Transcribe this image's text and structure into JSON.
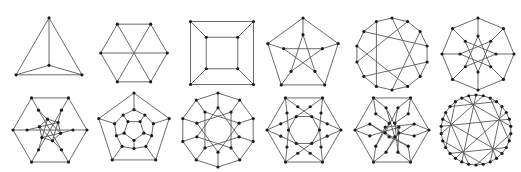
{
  "figure": {
    "edge_color": "#5a5a5a",
    "vertex_color": "#1c1c1c",
    "vertex_radius": 1.6
  },
  "graphs": [
    {
      "name": "K4",
      "row": 0,
      "cx": 49,
      "cy": 52,
      "r": 38,
      "kind": "k4"
    },
    {
      "name": "K3,3",
      "row": 0,
      "cx": 134,
      "cy": 53,
      "r": 37,
      "kind": "k33"
    },
    {
      "name": "Cube",
      "row": 0,
      "cx": 222,
      "cy": 53,
      "r": 45,
      "kind": "cube"
    },
    {
      "name": "Petersen",
      "row": 0,
      "cx": 303,
      "cy": 55,
      "r": 37,
      "kind": "gp",
      "n": 5,
      "k": 2,
      "inner": 0.55
    },
    {
      "name": "Heawood",
      "row": 0,
      "cx": 392,
      "cy": 54,
      "r": 36,
      "kind": "lcf",
      "n": 14,
      "lcf": [
        5,
        -5
      ]
    },
    {
      "name": "Mobius-Kantor",
      "row": 0,
      "cx": 478,
      "cy": 54,
      "r": 36,
      "kind": "gp",
      "n": 8,
      "k": 3,
      "inner": 0.5
    },
    {
      "name": "Pappus",
      "row": 1,
      "cx": 50,
      "cy": 130,
      "r": 37,
      "kind": "pappus"
    },
    {
      "name": "Dodecahedron",
      "row": 1,
      "cx": 134,
      "cy": 130,
      "r": 37,
      "kind": "dodeca"
    },
    {
      "name": "Desargues",
      "row": 1,
      "cx": 218,
      "cy": 130,
      "r": 37,
      "kind": "gp",
      "n": 10,
      "k": 3,
      "inner": 0.6
    },
    {
      "name": "Nauru",
      "row": 1,
      "cx": 304,
      "cy": 130,
      "r": 37,
      "kind": "nauru"
    },
    {
      "name": "F26A",
      "row": 1,
      "cx": 392,
      "cy": 130,
      "r": 37,
      "kind": "f26"
    },
    {
      "name": "Tutte-Coxeter",
      "row": 1,
      "cx": 476,
      "cy": 130,
      "r": 35,
      "kind": "lcf",
      "n": 30,
      "lcf": [
        -13,
        -9,
        7,
        -7,
        9,
        13
      ]
    }
  ]
}
